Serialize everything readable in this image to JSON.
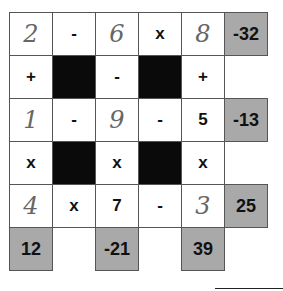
{
  "puzzle": {
    "rows": [
      [
        {
          "v": "2",
          "t": "hand"
        },
        {
          "v": "-",
          "t": "op"
        },
        {
          "v": "6",
          "t": "hand"
        },
        {
          "v": "x",
          "t": "op"
        },
        {
          "v": "8",
          "t": "hand"
        },
        {
          "v": "-32",
          "t": "gray"
        }
      ],
      [
        {
          "v": "+",
          "t": "op"
        },
        {
          "v": "",
          "t": "black"
        },
        {
          "v": "-",
          "t": "op"
        },
        {
          "v": "",
          "t": "black"
        },
        {
          "v": "+",
          "t": "op"
        },
        {
          "v": "",
          "t": "empty"
        }
      ],
      [
        {
          "v": "1",
          "t": "hand"
        },
        {
          "v": "-",
          "t": "op"
        },
        {
          "v": "9",
          "t": "hand"
        },
        {
          "v": "-",
          "t": "op"
        },
        {
          "v": "5",
          "t": "op"
        },
        {
          "v": "-13",
          "t": "gray"
        }
      ],
      [
        {
          "v": "x",
          "t": "op"
        },
        {
          "v": "",
          "t": "black"
        },
        {
          "v": "x",
          "t": "op"
        },
        {
          "v": "",
          "t": "black"
        },
        {
          "v": "x",
          "t": "op"
        },
        {
          "v": "",
          "t": "empty"
        }
      ],
      [
        {
          "v": "4",
          "t": "hand"
        },
        {
          "v": "x",
          "t": "op"
        },
        {
          "v": "7",
          "t": "op"
        },
        {
          "v": "-",
          "t": "op"
        },
        {
          "v": "3",
          "t": "hand"
        },
        {
          "v": "25",
          "t": "gray"
        }
      ],
      [
        {
          "v": "12",
          "t": "gray"
        },
        {
          "v": "",
          "t": "empty"
        },
        {
          "v": "-21",
          "t": "gray"
        },
        {
          "v": "",
          "t": "empty"
        },
        {
          "v": "39",
          "t": "gray"
        },
        {
          "v": "",
          "t": "empty"
        }
      ]
    ]
  }
}
